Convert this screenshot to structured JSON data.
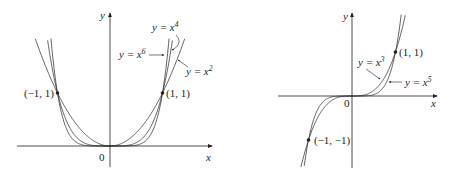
{
  "chart_data": [
    {
      "type": "line",
      "title": "",
      "xlabel": "x",
      "ylabel": "y",
      "origin_label": "0",
      "xlim": [
        -1.8,
        1.95
      ],
      "ylim": [
        -0.35,
        2.5
      ],
      "grid": false,
      "legend": "none (curves labeled inline)",
      "series": [
        {
          "name": "y = x^2",
          "label": "y = x",
          "exp": "2",
          "power": 2
        },
        {
          "name": "y = x^4",
          "label": "y = x",
          "exp": "4",
          "power": 4
        },
        {
          "name": "y = x^6",
          "label": "y = x",
          "exp": "6",
          "power": 6
        }
      ],
      "points": [
        {
          "x": -1,
          "y": 1,
          "label": "(−1, 1)"
        },
        {
          "x": 1,
          "y": 1,
          "label": "(1, 1)"
        }
      ]
    },
    {
      "type": "line",
      "title": "",
      "xlabel": "x",
      "ylabel": "y",
      "origin_label": "0",
      "xlim": [
        -1.7,
        1.9
      ],
      "ylim": [
        -1.65,
        1.85
      ],
      "grid": false,
      "legend": "none (curves labeled inline)",
      "series": [
        {
          "name": "y = x^3",
          "label": "y = x",
          "exp": "3",
          "power": 3
        },
        {
          "name": "y = x^5",
          "label": "y = x",
          "exp": "5",
          "power": 5
        }
      ],
      "points": [
        {
          "x": 1,
          "y": 1,
          "label": "(1, 1)"
        },
        {
          "x": -1,
          "y": -1,
          "label": "(−1, −1)"
        }
      ]
    }
  ],
  "labels": {
    "left": {
      "y_axis": "y",
      "x_axis": "x",
      "origin": "0",
      "pt_neg": "(−1, 1)",
      "pt_pos": "(1, 1)",
      "x4_base": "y = x",
      "x4_exp": "4",
      "x6_base": "y = x",
      "x6_exp": "6",
      "x2_base": "y = x",
      "x2_exp": "2"
    },
    "right": {
      "y_axis": "y",
      "x_axis": "x",
      "origin": "0",
      "pt_pos": "(1, 1)",
      "pt_neg": "(−1, −1)",
      "x3_base": "y = x",
      "x3_exp": "3",
      "x5_base": "y = x",
      "x5_exp": "5"
    }
  },
  "colors": {
    "ink": "#231f20",
    "background": "#ffffff"
  }
}
